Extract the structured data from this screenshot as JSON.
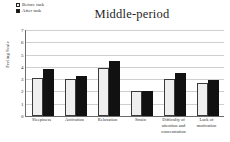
{
  "chart_data": {
    "type": "bar",
    "title": "Middle-period",
    "xlabel": "",
    "ylabel": "Feeling Scale",
    "ylim": [
      0,
      7
    ],
    "yticks": [
      "0",
      "1",
      "2",
      "3",
      "4",
      "5",
      "6",
      "7"
    ],
    "grid": true,
    "legend_position": "top-left",
    "categories": [
      "Sleepiness",
      "Activation",
      "Relaxation",
      "Strain",
      "Difficulty of attention and concentration",
      "Lack of motivation"
    ],
    "category_lines": [
      [
        "Sleepiness"
      ],
      [
        "Activation"
      ],
      [
        "Relaxation"
      ],
      [
        "Strain"
      ],
      [
        "Difficulty of",
        "attention and",
        "concentration"
      ],
      [
        "Lack of",
        "motivation"
      ]
    ],
    "series": [
      {
        "name": "Before task",
        "color": "#efefef",
        "values": [
          3.1,
          3.05,
          3.9,
          2.05,
          3.0,
          2.7
        ]
      },
      {
        "name": "After task",
        "color": "#111111",
        "values": [
          3.8,
          3.25,
          4.45,
          2.0,
          3.5,
          2.95
        ]
      }
    ]
  },
  "legend": {
    "items": [
      {
        "label": "Before task",
        "marker": "open-square"
      },
      {
        "label": "After task",
        "marker": "filled-square"
      }
    ]
  }
}
